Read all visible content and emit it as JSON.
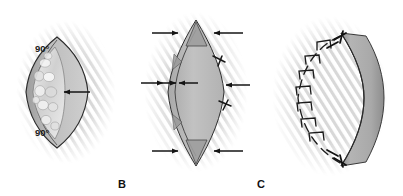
{
  "figure": {
    "modality": "grayscale medical line illustration",
    "background_color": "#ffffff",
    "ink_color": "#1a1a1a",
    "tissue_fill": "#b9b9b9",
    "flap_fill": "#a8a8a8",
    "lesion_fill": "#d8d8d8",
    "halo_color": "#cfcfcf"
  },
  "panels": [
    {
      "id": "A",
      "letter": "",
      "letter_visible": false,
      "caption": "Elliptical excision with 90 degree apical angles",
      "labels": [
        {
          "name": "angle-top",
          "text": "90°"
        },
        {
          "name": "angle-bottom",
          "text": "90°"
        }
      ],
      "arrows": [
        {
          "name": "lesion-pointer-arrow",
          "direction": "left",
          "count": 1
        }
      ],
      "features": [
        "lens-outline",
        "mottled-lesion-region",
        "undermined-edge"
      ]
    },
    {
      "id": "B",
      "letter": "B",
      "letter_visible": true,
      "caption": "Closure under tension with approximating vectors and interrupted sutures",
      "labels": [],
      "arrows": [
        {
          "name": "tension-arrow-top-left",
          "direction": "right"
        },
        {
          "name": "tension-arrow-top-right",
          "direction": "left"
        },
        {
          "name": "tension-arrow-mid-left-outer",
          "direction": "right"
        },
        {
          "name": "tension-arrow-mid-left-inner",
          "direction": "right"
        },
        {
          "name": "tension-arrow-mid-center",
          "direction": "left"
        },
        {
          "name": "tension-arrow-mid-right",
          "direction": "left"
        },
        {
          "name": "tension-arrow-bottom-left",
          "direction": "right"
        },
        {
          "name": "tension-arrow-bottom-right",
          "direction": "left"
        }
      ],
      "features": [
        "lens-outline",
        "pointed-apices",
        "edge-sutures",
        "dog-ear-triangles"
      ]
    },
    {
      "id": "C",
      "letter": "C",
      "letter_visible": true,
      "caption": "Completed closure with interrupted sutures along advanced flap edge",
      "labels": [],
      "arrows": [],
      "features": [
        "crescent-flap",
        "interrupted-suture-row",
        "suture-knots",
        "closed-incision-line"
      ]
    }
  ],
  "panel_letters": {
    "a": "",
    "b": "B",
    "c": "C"
  },
  "angle_text": "90°"
}
